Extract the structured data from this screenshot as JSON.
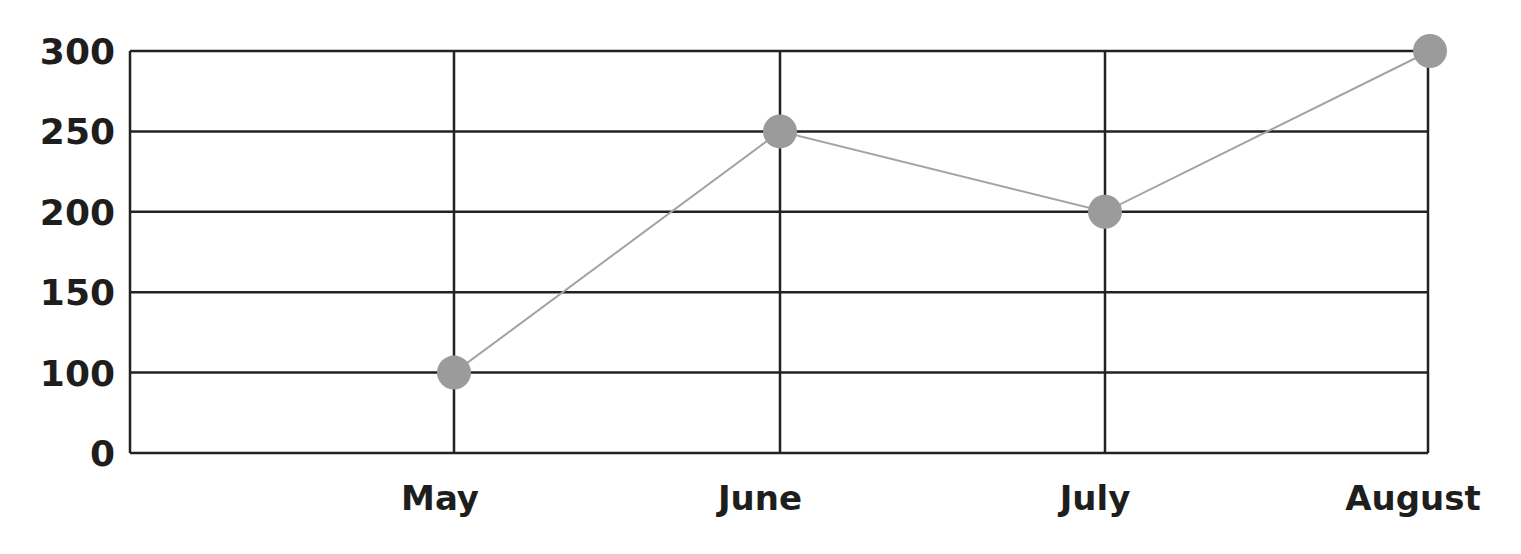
{
  "chart_data": {
    "type": "line",
    "title": "",
    "xlabel": "",
    "ylabel": "",
    "categories": [
      "May",
      "June",
      "July",
      "August"
    ],
    "series": [
      {
        "name": "Series 1",
        "values": [
          100,
          250,
          200,
          300
        ]
      }
    ],
    "y_ticks": [
      "0",
      "100",
      "150",
      "200",
      "250",
      "300"
    ],
    "ylim": [
      0,
      300
    ],
    "grid": true,
    "legend": "none",
    "colors": {
      "line": "#a3a3a3",
      "marker": "#9b9b9b",
      "grid": "#222222",
      "text": "#1e1e1e"
    }
  }
}
